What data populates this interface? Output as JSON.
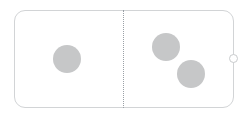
{
  "canvas": {
    "width": 248,
    "height": 119,
    "background_color": "#ffffff",
    "title": "Shape canvas"
  },
  "frame": {
    "name": "rounded-rectangle-container",
    "label": "Rounded rectangle container",
    "x": 14,
    "y": 10,
    "width": 220,
    "height": 98,
    "corner_radius": 11,
    "border_color": "#d2d4d6",
    "border_width": 1,
    "fill_color": "#ffffff"
  },
  "divider": {
    "name": "vertical-dotted-divider",
    "label": "Vertical dotted divider",
    "x": 123,
    "y_top": 10,
    "y_bottom": 108,
    "style": "dotted",
    "color": "#9aa0a6",
    "width": 1
  },
  "handle": {
    "name": "resize-handle-right",
    "label": "Right edge resize handle",
    "x": 229,
    "y": 54,
    "diameter": 9,
    "border_color": "#c9cbcd",
    "fill_color": "#ffffff"
  },
  "circles": [
    {
      "name": "circle-left",
      "label": "Left circle",
      "cx": 67,
      "cy": 59,
      "diameter": 28,
      "fill_color": "#c6c7c8",
      "side": "left"
    },
    {
      "name": "circle-right-upper",
      "label": "Upper right circle",
      "cx": 166,
      "cy": 47,
      "diameter": 28,
      "fill_color": "#c6c7c8",
      "side": "right"
    },
    {
      "name": "circle-right-lower",
      "label": "Lower right circle",
      "cx": 191,
      "cy": 74,
      "diameter": 28,
      "fill_color": "#c6c7c8",
      "side": "right"
    }
  ],
  "counts": {
    "left_panel_circles": "1",
    "right_panel_circles": "2",
    "total_circles": "3"
  }
}
